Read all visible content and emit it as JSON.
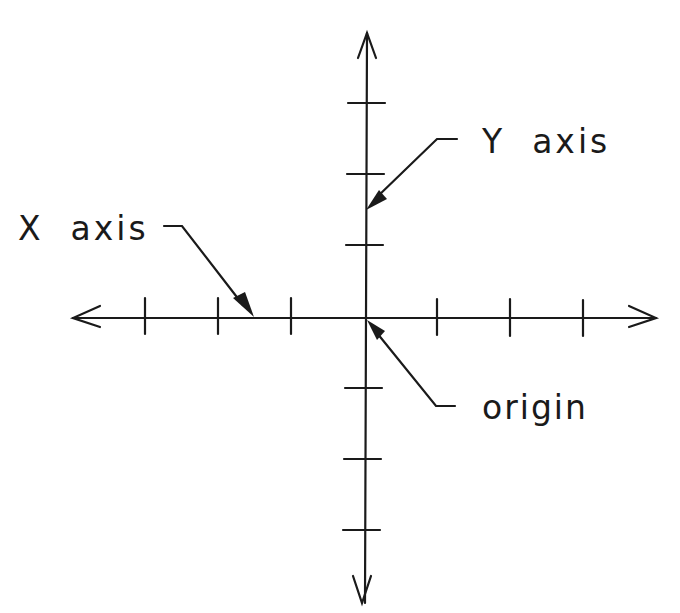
{
  "diagram": {
    "labels": {
      "x_axis": "X  axis",
      "y_axis": "Y  axis",
      "origin": "origin"
    },
    "axes": {
      "x_ticks_per_side": 3,
      "y_ticks_per_side": 3,
      "arrows_both_ends": true
    },
    "colors": {
      "stroke": "#1a1a1a",
      "background": "#ffffff"
    }
  }
}
